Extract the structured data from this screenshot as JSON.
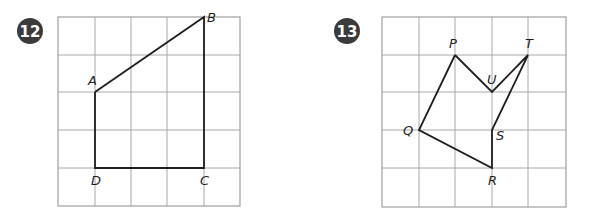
{
  "problems": [
    {
      "number": "12",
      "badge": {
        "cx": 30,
        "cy": 31,
        "r": 13
      },
      "grid": {
        "x_lines": [
          58,
          95,
          131,
          167,
          204,
          240
        ],
        "y_lines": [
          17,
          55,
          92,
          130,
          168,
          206
        ],
        "columns": 5,
        "rows": 5
      },
      "vertices": [
        {
          "name": "A",
          "col": 1,
          "row": 2,
          "label_dx": -7,
          "label_dy": -7
        },
        {
          "name": "B",
          "col": 4,
          "row": 0,
          "label_dx": 3,
          "label_dy": 5
        },
        {
          "name": "C",
          "col": 4,
          "row": 4,
          "label_dx": -4,
          "label_dy": 17
        },
        {
          "name": "D",
          "col": 1,
          "row": 4,
          "label_dx": -4,
          "label_dy": 17
        }
      ],
      "path": [
        "A",
        "B",
        "C",
        "D",
        "A"
      ]
    },
    {
      "number": "13",
      "badge": {
        "cx": 347,
        "cy": 31,
        "r": 13
      },
      "grid": {
        "x_lines": [
          382,
          419,
          455,
          492,
          528,
          566
        ],
        "y_lines": [
          17,
          55,
          92,
          130,
          168,
          207
        ],
        "columns": 5,
        "rows": 5
      },
      "vertices": [
        {
          "name": "P",
          "col": 2,
          "row": 1,
          "label_dx": -6,
          "label_dy": -7
        },
        {
          "name": "U",
          "col": 3,
          "row": 2,
          "label_dx": -5,
          "label_dy": -8
        },
        {
          "name": "T",
          "col": 4,
          "row": 1,
          "label_dx": -3,
          "label_dy": -7
        },
        {
          "name": "S",
          "col": 3,
          "row": 3,
          "label_dx": 4,
          "label_dy": 10
        },
        {
          "name": "R",
          "col": 3,
          "row": 4,
          "label_dx": -4,
          "label_dy": 17
        },
        {
          "name": "Q",
          "col": 1,
          "row": 3,
          "label_dx": -16,
          "label_dy": 5
        }
      ],
      "path": [
        "P",
        "U",
        "T",
        "S",
        "R",
        "Q",
        "P"
      ]
    }
  ],
  "colors": {
    "grid": "#a8a8a8",
    "shape": "#1e1e1e",
    "badge": "#3b3b3b",
    "badge_text": "#ffffff"
  }
}
